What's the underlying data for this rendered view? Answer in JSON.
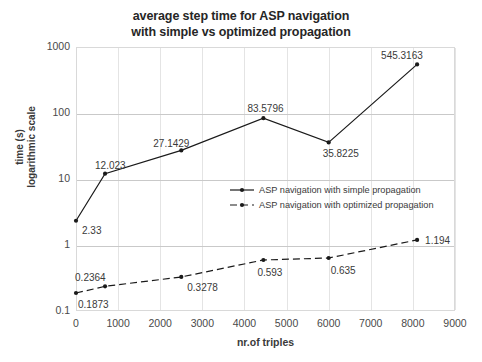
{
  "chart_data": {
    "type": "line",
    "title": "average step time for ASP navigation with simple vs optimized propagation",
    "title_line1": "average step time for ASP navigation",
    "title_line2": "with simple vs optimized propagation",
    "xlabel": "nr.of triples",
    "ylabel": "time (s)",
    "ylabel_line1": "time (s)",
    "ylabel_line2": "logarithmic scale",
    "yscale": "log",
    "ylim": [
      0.1,
      1000
    ],
    "xlim": [
      0,
      9000
    ],
    "grid": true,
    "legend_position": "inside-right",
    "y_ticks": [
      "0.1",
      "1",
      "10",
      "100",
      "1000"
    ],
    "y_tick_values": [
      0.1,
      1,
      10,
      100,
      1000
    ],
    "x_ticks": [
      "0",
      "1000",
      "2000",
      "3000",
      "4000",
      "5000",
      "6000",
      "7000",
      "8000",
      "9000"
    ],
    "x_tick_values": [
      0,
      1000,
      2000,
      3000,
      4000,
      5000,
      6000,
      7000,
      8000,
      9000
    ],
    "series": [
      {
        "name": "ASP navigation with simple propagation",
        "style": "solid",
        "color": "#1a1a1a",
        "x": [
          0,
          690,
          2500,
          4450,
          6000,
          8100
        ],
        "values": [
          2.33,
          12.023,
          27.1429,
          83.5796,
          35.8225,
          545.3163
        ],
        "data_labels": [
          "2.33",
          "12.023",
          "27.1429",
          "83.5796",
          "35.8225",
          "545.3163"
        ]
      },
      {
        "name": "ASP navigation with optimized propagation",
        "style": "dashed",
        "color": "#1a1a1a",
        "x": [
          0,
          690,
          2500,
          4450,
          6000,
          8100
        ],
        "values": [
          0.1873,
          0.2364,
          0.3278,
          0.593,
          0.635,
          1.194
        ],
        "data_labels": [
          "0.1873",
          "0.2364",
          "0.3278",
          "0.593",
          "0.635",
          "1.194"
        ]
      }
    ]
  }
}
